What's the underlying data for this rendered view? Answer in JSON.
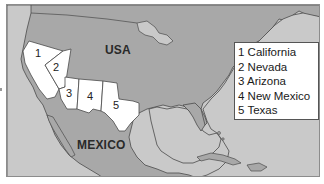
{
  "map": {
    "title": "",
    "labels": {
      "usa": "USA",
      "mexico": "MEXICO"
    },
    "states": [
      {
        "number": "1",
        "name": "California"
      },
      {
        "number": "2",
        "name": "Nevada"
      },
      {
        "number": "3",
        "name": "Arizona"
      },
      {
        "number": "4",
        "name": "New Mexico"
      },
      {
        "number": "5",
        "name": "Texas"
      }
    ],
    "legend": {
      "items": [
        "1 California",
        "2 Nevada",
        "3 Arizona",
        "4 New Mexico",
        "5 Texas"
      ]
    },
    "colors": {
      "land": "#a8a8a8",
      "water": "#c9c9c9",
      "highlighted_states": "#ffffff",
      "border": "#4a4a4a"
    }
  }
}
